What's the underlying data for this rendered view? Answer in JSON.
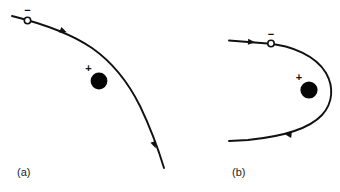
{
  "figure": {
    "background_color": "#ffffff",
    "stroke_color": "#111111",
    "width": 340,
    "height": 192
  },
  "panels": [
    {
      "id": "panel-a",
      "label": "(a)",
      "label_x": 17,
      "label_y": 173,
      "description": "Small-angle hyperbolic deflection of a negative particle passing a positive nucleus",
      "incoming_particle": {
        "name": "electron",
        "charge_sign": "−",
        "marker": "open-circle",
        "circle_x": 27.5,
        "circle_y": 20.5,
        "circle_r": 3.2,
        "sign_x": 27.5,
        "sign_y": 11.5
      },
      "nucleus": {
        "name": "nucleus",
        "charge_sign": "+",
        "marker": "filled-circle",
        "dot_x": 99,
        "dot_y": 81,
        "dot_r": 8.4,
        "sign_x": 88.5,
        "sign_y": 69
      },
      "trajectory": {
        "path": "M 12 16 C 40 23, 70 33, 92 48 C 112 62, 128 82, 140 106 C 150 127, 158 148, 164 168",
        "arrows": [
          {
            "x": 63.5,
            "y": 31.0,
            "angle": 22,
            "name": "direction-arrow-upper"
          },
          {
            "x": 154.5,
            "y": 145.0,
            "angle": 69,
            "name": "direction-arrow-lower"
          }
        ]
      }
    },
    {
      "id": "panel-b",
      "label": "(b)",
      "label_x": 232,
      "label_y": 173,
      "description": "Large-angle backscattering: the negative particle loops around the positive nucleus and reverses direction",
      "incoming_particle": {
        "name": "electron",
        "charge_sign": "−",
        "marker": "open-circle",
        "circle_x": 271,
        "circle_y": 43.5,
        "circle_r": 3.2,
        "sign_x": 271,
        "sign_y": 35.0
      },
      "nucleus": {
        "name": "nucleus",
        "charge_sign": "+",
        "marker": "filled-circle",
        "dot_x": 309,
        "dot_y": 90,
        "dot_r": 8.6,
        "sign_x": 299,
        "sign_y": 78
      },
      "trajectory": {
        "path": "M 229 40.5 L 267.5 43.5 C 292 45.5, 316 56, 326 73 C 334 87, 333 103, 322 115 C 308 130, 278 137, 248 140 L 229 141",
        "arrows": [
          {
            "x": 251.5,
            "y": 42.0,
            "angle": 4,
            "name": "direction-arrow-incoming"
          },
          {
            "x": 288.0,
            "y": 134.5,
            "angle": 187,
            "name": "direction-arrow-outgoing"
          }
        ]
      }
    }
  ],
  "legend_semantics": {
    "minus_meaning": "negatively charged incident particle",
    "plus_meaning": "positively charged scattering center",
    "arrow_meaning": "direction of motion along the trajectory"
  }
}
